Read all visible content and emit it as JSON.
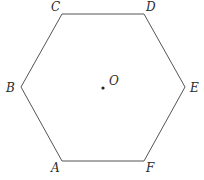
{
  "diagram": {
    "shape": "regular-hexagon",
    "stroke_color": "#555555",
    "background": "#ffffff",
    "vertices": [
      {
        "label": "A",
        "x": 62,
        "y": 161,
        "label_x": 51,
        "label_y": 172
      },
      {
        "label": "B",
        "x": 21,
        "y": 87,
        "label_x": 6,
        "label_y": 92
      },
      {
        "label": "C",
        "x": 62,
        "y": 14,
        "label_x": 51,
        "label_y": 11
      },
      {
        "label": "D",
        "x": 144,
        "y": 14,
        "label_x": 146,
        "label_y": 11
      },
      {
        "label": "E",
        "x": 185,
        "y": 87,
        "label_x": 190,
        "label_y": 92
      },
      {
        "label": "F",
        "x": 144,
        "y": 161,
        "label_x": 146,
        "label_y": 172
      }
    ],
    "center": {
      "label": "O",
      "x": 103,
      "y": 88,
      "label_x": 109,
      "label_y": 85
    }
  }
}
